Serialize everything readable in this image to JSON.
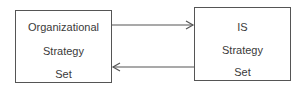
{
  "diagram": {
    "left_box": {
      "lines": [
        "Organizational",
        "Strategy",
        "Set"
      ]
    },
    "right_box": {
      "lines": [
        "IS",
        "Strategy",
        "Set"
      ]
    },
    "edges": [
      {
        "from": "left_box",
        "to": "right_box",
        "direction": "right",
        "position": "top"
      },
      {
        "from": "right_box",
        "to": "left_box",
        "direction": "left",
        "position": "bottom"
      }
    ],
    "colors": {
      "stroke": "#555555",
      "text": "#3a3a3a"
    }
  }
}
